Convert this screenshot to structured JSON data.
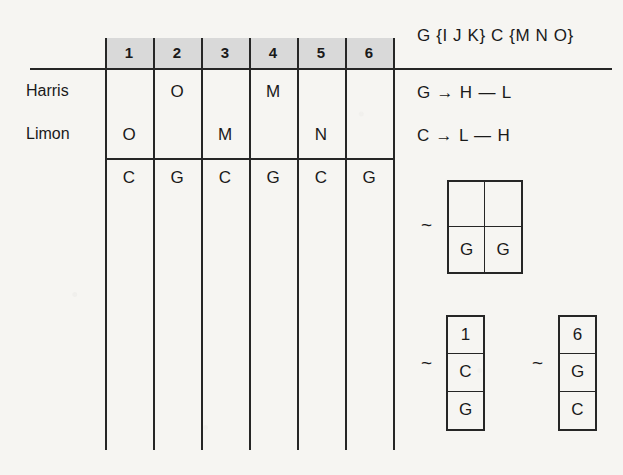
{
  "page": {
    "background_color": "#f6f5f2",
    "ink_color": "#1a1a1a",
    "header_band_color": "#d9d9d9"
  },
  "table": {
    "column_headers": [
      "1",
      "2",
      "3",
      "4",
      "5",
      "6"
    ],
    "rows": [
      {
        "label": "Harris",
        "cells": [
          "",
          "O",
          "",
          "M",
          "",
          ""
        ]
      },
      {
        "label": "Limon",
        "cells": [
          "O",
          "",
          "M",
          "",
          "N",
          ""
        ]
      }
    ],
    "summary_row": {
      "label": "",
      "cells": [
        "C",
        "G",
        "C",
        "G",
        "C",
        "G"
      ]
    }
  },
  "notes": {
    "sets_line": "G {I  J  K}  C {M  N  O}",
    "rules": [
      "G → H — L",
      "C → L — H"
    ],
    "tilde_symbol": "~",
    "punnett": {
      "cells": [
        "",
        "",
        "G",
        "G"
      ]
    },
    "stacks": [
      {
        "cells": [
          "1",
          "C",
          "G"
        ]
      },
      {
        "cells": [
          "6",
          "G",
          "C"
        ]
      }
    ]
  }
}
